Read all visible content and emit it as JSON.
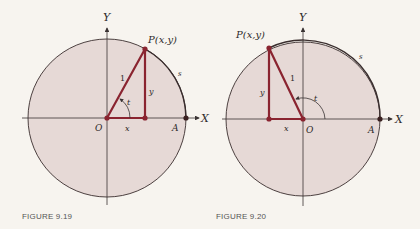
{
  "colors": {
    "background": "#f7f4ef",
    "disk_fill": "#e6d9d6",
    "circle_stroke": "#3a2e2e",
    "axis_stroke": "#3a3333",
    "triangle": "#8a2430",
    "text": "#2e2a2a",
    "caption": "#555555"
  },
  "figures": [
    {
      "caption": "FIGURE 9.19",
      "center": [
        107,
        118
      ],
      "radius": 79,
      "point_P": [
        145,
        49
      ],
      "foot": [
        145,
        118
      ],
      "point_A": [
        186,
        118
      ],
      "labels": {
        "Y": "Y",
        "X": "X",
        "P": "P(x,y)",
        "O": "O",
        "A": "A",
        "s": "s",
        "x": "x",
        "y": "y",
        "one": "1",
        "t": "t"
      }
    },
    {
      "caption": "FIGURE 9.20",
      "center": [
        303,
        119
      ],
      "radius": 77,
      "point_P": [
        269,
        48
      ],
      "foot": [
        269,
        119
      ],
      "point_A": [
        380,
        119
      ],
      "labels": {
        "Y": "Y",
        "X": "X",
        "P": "P(x,y)",
        "O": "O",
        "A": "A",
        "s": "s",
        "x": "x",
        "y": "y",
        "one": "1",
        "t": "t"
      }
    }
  ]
}
